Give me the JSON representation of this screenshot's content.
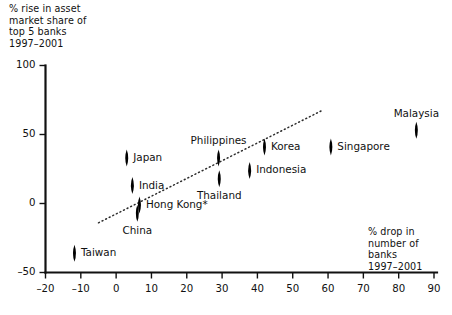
{
  "chart_data": {
    "type": "scatter",
    "title": "",
    "xlabel": "% drop in number of banks 1997–2001",
    "ylabel": "% rise in asset market share of top 5 banks 1997–2001",
    "xlim": [
      -20,
      90
    ],
    "ylim": [
      -50,
      100
    ],
    "xticks": [
      -20,
      -10,
      0,
      10,
      20,
      30,
      40,
      50,
      60,
      70,
      80,
      90
    ],
    "yticks": [
      -50,
      0,
      50,
      100
    ],
    "xtick_labels": [
      "–20",
      "–10",
      "0",
      "10",
      "20",
      "30",
      "40",
      "50",
      "60",
      "70",
      "80",
      "90"
    ],
    "ytick_labels": [
      "–50",
      "0",
      "50",
      "100"
    ],
    "grid": false,
    "legend": "none",
    "marker_style": "filled-diamond",
    "points": [
      {
        "label": "Taiwan",
        "x": -11.8,
        "y": -36,
        "label_pos": "right"
      },
      {
        "label": "China",
        "x": 6.0,
        "y": -7,
        "label_pos": "below"
      },
      {
        "label": "Hong Kong*",
        "x": 6.6,
        "y": -1,
        "label_pos": "right"
      },
      {
        "label": "India",
        "x": 4.6,
        "y": 13,
        "label_pos": "right"
      },
      {
        "label": "Japan",
        "x": 3.0,
        "y": 33,
        "label_pos": "right"
      },
      {
        "label": "Thailand",
        "x": 29.2,
        "y": 18,
        "label_pos": "below"
      },
      {
        "label": "Philippines",
        "x": 29.0,
        "y": 33,
        "label_pos": "above"
      },
      {
        "label": "Indonesia",
        "x": 37.8,
        "y": 24,
        "label_pos": "right"
      },
      {
        "label": "Korea",
        "x": 42.0,
        "y": 41,
        "label_pos": "right"
      },
      {
        "label": "Singapore",
        "x": 60.8,
        "y": 41,
        "label_pos": "right"
      },
      {
        "label": "Malaysia",
        "x": 85.0,
        "y": 53,
        "label_pos": "above"
      }
    ],
    "trend_line": {
      "style": "dotted",
      "x_start": -5.0,
      "y_start": -14.0,
      "x_end": 58.0,
      "y_end": 67.0
    },
    "footnote_marker": "*",
    "colors": {
      "marker": "#000000",
      "axis": "#111111",
      "trend": "#2b2b2b",
      "background": "#ffffff"
    }
  }
}
